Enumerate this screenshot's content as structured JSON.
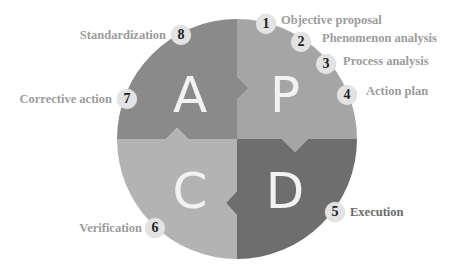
{
  "diagram": {
    "quadrants": [
      {
        "id": "A",
        "letter": "A",
        "meaning": "Act",
        "color": "#8a8a8a"
      },
      {
        "id": "P",
        "letter": "P",
        "meaning": "Plan",
        "color": "#a5a5a5"
      },
      {
        "id": "C",
        "letter": "C",
        "meaning": "Check",
        "color": "#b3b3b3"
      },
      {
        "id": "D",
        "letter": "D",
        "meaning": "Do",
        "color": "#6e6e6e"
      }
    ],
    "letter_color": "#f2f2f2",
    "steps": [
      {
        "number": "1",
        "label": "Objective proposal",
        "quadrant": "P"
      },
      {
        "number": "2",
        "label": "Phenomenon analysis",
        "quadrant": "P"
      },
      {
        "number": "3",
        "label": "Process analysis",
        "quadrant": "P"
      },
      {
        "number": "4",
        "label": "Action plan",
        "quadrant": "P"
      },
      {
        "number": "5",
        "label": "Execution",
        "quadrant": "D"
      },
      {
        "number": "6",
        "label": "Verification",
        "quadrant": "C"
      },
      {
        "number": "7",
        "label": "Corrective action",
        "quadrant": "A"
      },
      {
        "number": "8",
        "label": "Standardization",
        "quadrant": "A"
      }
    ],
    "badge_color": "#e3e3e3",
    "label_color": "#9c9c9c",
    "label_color_dark": "#6a6a6a"
  }
}
